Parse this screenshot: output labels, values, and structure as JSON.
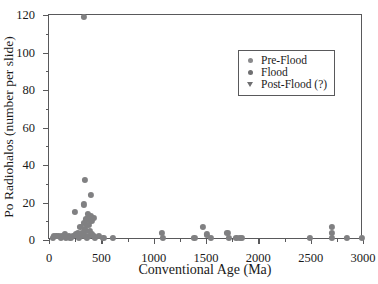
{
  "chart_data": {
    "type": "scatter",
    "title": "",
    "xlabel": "Conventional Age (Ma)",
    "ylabel": "Po Radiohalos (number per slide)",
    "xlim": [
      0,
      3000
    ],
    "ylim": [
      0,
      120
    ],
    "xticks": [
      0,
      500,
      1000,
      1500,
      2000,
      2500,
      3000
    ],
    "xtick_labels": [
      "0",
      "500",
      "1000",
      "1500",
      "2000",
      "2500",
      "3000"
    ],
    "xminor_ticks": [
      250,
      750,
      1250,
      1750,
      2250,
      2750
    ],
    "yticks": [
      0,
      20,
      40,
      60,
      80,
      100,
      120
    ],
    "ytick_labels": [
      "0",
      "20",
      "40",
      "60",
      "80",
      "100",
      "120"
    ],
    "yminor_ticks": [
      10,
      30,
      50,
      70,
      90,
      110
    ],
    "grid": false,
    "legend_position": "upper-center-right",
    "marker_color": "#808082",
    "frame_color": "#59595b",
    "legend": [
      {
        "name": "Pre-Flood",
        "marker": "circle",
        "color": "#8a8a8c"
      },
      {
        "name": "Flood",
        "marker": "circle",
        "color": "#7a7a7c"
      },
      {
        "name": "Post-Flood (?)",
        "marker": "triangle-down",
        "color": "#7a7a7c"
      }
    ],
    "series": [
      {
        "name": "Flood",
        "marker": "circle",
        "color": "#808082",
        "points": [
          [
            330,
            119
          ],
          [
            345,
            32
          ],
          [
            400,
            24
          ],
          [
            330,
            19
          ],
          [
            250,
            15
          ],
          [
            375,
            14
          ],
          [
            395,
            13
          ],
          [
            370,
            12
          ],
          [
            425,
            12
          ],
          [
            350,
            11
          ],
          [
            405,
            10
          ],
          [
            330,
            9
          ],
          [
            365,
            8
          ],
          [
            385,
            8
          ],
          [
            300,
            7
          ],
          [
            340,
            6
          ],
          [
            355,
            5
          ],
          [
            390,
            5
          ],
          [
            275,
            4
          ],
          [
            320,
            4
          ],
          [
            410,
            3
          ],
          [
            260,
            3
          ],
          [
            300,
            2
          ],
          [
            345,
            2
          ],
          [
            380,
            2
          ],
          [
            430,
            2
          ],
          [
            480,
            2
          ],
          [
            230,
            2
          ],
          [
            190,
            2
          ],
          [
            150,
            3
          ],
          [
            120,
            2
          ],
          [
            95,
            2
          ],
          [
            70,
            2
          ],
          [
            50,
            2
          ],
          [
            35,
            1
          ],
          [
            110,
            1
          ],
          [
            165,
            1
          ],
          [
            205,
            1
          ],
          [
            285,
            1
          ],
          [
            360,
            1
          ],
          [
            440,
            1
          ],
          [
            520,
            1
          ],
          [
            610,
            1
          ]
        ]
      },
      {
        "name": "Pre-Flood",
        "marker": "circle",
        "color": "#808082",
        "points": [
          [
            1080,
            4
          ],
          [
            1090,
            1
          ],
          [
            1390,
            1
          ],
          [
            1470,
            7
          ],
          [
            1510,
            3
          ],
          [
            1545,
            1
          ],
          [
            1705,
            4
          ],
          [
            1715,
            1
          ],
          [
            1790,
            1
          ],
          [
            1825,
            1
          ],
          [
            1845,
            1
          ],
          [
            2490,
            1
          ],
          [
            2700,
            7
          ],
          [
            2700,
            4
          ],
          [
            2700,
            1
          ],
          [
            2845,
            1
          ],
          [
            2990,
            1
          ]
        ]
      }
    ]
  },
  "legend_box": {
    "items": [
      "Pre-Flood",
      "Flood",
      "Post-Flood (?)"
    ]
  }
}
